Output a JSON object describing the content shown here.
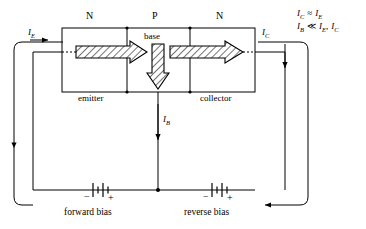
{
  "figure": {
    "kind": "npn-transistor-bias-circuit",
    "regions": {
      "left_semiconductor": "N",
      "middle_semiconductor": "P",
      "right_semiconductor": "N"
    },
    "terminals": {
      "emitter": "emitter",
      "base": "base",
      "collector": "collector"
    },
    "currents": {
      "emitter_current": "I",
      "emitter_current_sub": "E",
      "collector_current": "I",
      "collector_current_sub": "C",
      "base_current": "I",
      "base_current_sub": "B"
    },
    "bias": {
      "left_source": "forward bias",
      "right_source": "reverse bias",
      "minus": "−",
      "plus": "+"
    },
    "equations": [
      {
        "lhs": "I",
        "lhs_sub": "C",
        "rel": "≈",
        "rhs": "I",
        "rhs_sub": "E"
      },
      {
        "lhs": "I",
        "lhs_sub": "B",
        "rel": "≪",
        "rhs": "I",
        "rhs_sub": "E",
        "rhs2": "I",
        "rhs2_sub": "C",
        "sep": ","
      }
    ],
    "equation_lines": [
      "I_C ≈ I_E",
      "I_B ≪ I_E, I_C"
    ],
    "colors": {
      "ink": "#000000",
      "background": "#ffffff",
      "hatch": "#000000"
    }
  }
}
